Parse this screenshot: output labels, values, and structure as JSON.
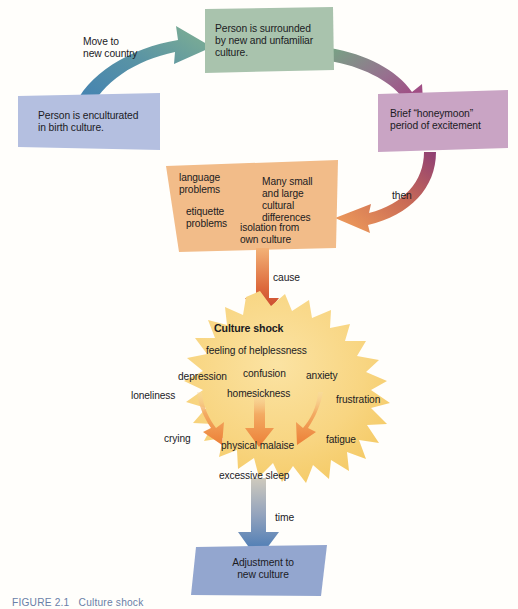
{
  "figure": {
    "caption": "FIGURE 2.1   Culture shock",
    "background_color": "#fffefb"
  },
  "nodes": {
    "birth_culture": {
      "id": "birth-culture-box",
      "text": "Person is enculturated\nin birth culture.",
      "color": "#b4bfe0",
      "shape": "parallelogram"
    },
    "new_culture": {
      "id": "new-culture-box",
      "text": "Person is surrounded\nby new and unfamiliar\nculture.",
      "color": "#a9c3ad",
      "shape": "parallelogram"
    },
    "honeymoon": {
      "id": "honeymoon-box",
      "text": "Brief “honeymoon”\nperiod of excitement",
      "color": "#c9a4c4",
      "shape": "parallelogram"
    },
    "problems": {
      "id": "problems-box",
      "color": "#f2bc89",
      "shape": "trapezoid",
      "items": [
        {
          "label": "language\nproblems"
        },
        {
          "label": "Many small\nand large\ncultural\ndifferences"
        },
        {
          "label": "etiquette\nproblems"
        },
        {
          "label": "isolation from\nown culture"
        }
      ]
    },
    "culture_shock": {
      "id": "culture-shock-starburst",
      "title": "Culture shock",
      "color": "#f7d47e",
      "shape": "starburst",
      "symptoms": [
        {
          "label": "feeling of helplessness"
        },
        {
          "label": "depression"
        },
        {
          "label": "confusion"
        },
        {
          "label": "anxiety"
        },
        {
          "label": "loneliness"
        },
        {
          "label": "homesickness"
        },
        {
          "label": "frustration"
        },
        {
          "label": "crying"
        },
        {
          "label": "physical malaise"
        },
        {
          "label": "fatigue"
        },
        {
          "label": "excessive sleep"
        }
      ]
    },
    "adjustment": {
      "id": "adjustment-box",
      "text": "Adjustment to\nnew culture",
      "color": "#93a6cf",
      "shape": "parallelogram"
    }
  },
  "edges": [
    {
      "id": "move-arrow",
      "label": "Move to\nnew country",
      "from": "birth_culture",
      "to": "new_culture",
      "color_start": "#3f7fb5",
      "color_end": "#7fae90"
    },
    {
      "id": "to-honeymoon-arrow",
      "label": "",
      "from": "new_culture",
      "to": "honeymoon",
      "color_start": "#6fa07f",
      "color_end": "#ab3f80"
    },
    {
      "id": "then-arrow",
      "label": "then",
      "from": "honeymoon",
      "to": "problems",
      "color_start": "#8e3f74",
      "color_end": "#f0943f"
    },
    {
      "id": "cause-arrow",
      "label": "cause",
      "from": "problems",
      "to": "culture_shock",
      "color_start": "#f0a860",
      "color_end": "#c43a2a"
    },
    {
      "id": "time-arrow",
      "label": "time",
      "from": "culture_shock",
      "to": "adjustment",
      "color_start": "#b8b8ae",
      "color_end": "#3f75b5"
    }
  ],
  "inner_arrows": {
    "id": "symptom-flow-arrows",
    "count": 3,
    "color": "#ef8f46"
  }
}
